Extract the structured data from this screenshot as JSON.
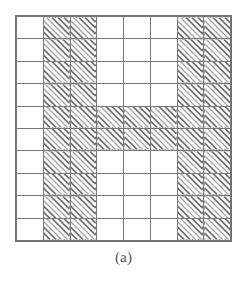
{
  "figure": {
    "caption": "(a)",
    "kind": "binary-grid-pattern",
    "depicted_glyph": "H",
    "colors": {
      "background": "#ffffff",
      "grid_line": "#787878",
      "border": "#6e6e6e",
      "hatch_line": "#4a4a4a",
      "caption_text": "#565656"
    }
  },
  "chart_data": {
    "type": "heatmap",
    "title": "",
    "subtitle": "",
    "xlabel": "",
    "ylabel": "",
    "legend": [],
    "annotations": [
      "(a)"
    ],
    "grid": true,
    "columns": 8,
    "rows": 10,
    "value_legend": {
      "0": "empty cell (white, unfilled)",
      "1": "filled cell (diagonal hatching)"
    },
    "column_labels": [
      "1",
      "2",
      "3",
      "4",
      "5",
      "6",
      "7",
      "8"
    ],
    "row_labels": [
      "1",
      "2",
      "3",
      "4",
      "5",
      "6",
      "7",
      "8",
      "9",
      "10"
    ],
    "values": [
      [
        0,
        1,
        1,
        0,
        0,
        0,
        1,
        1
      ],
      [
        0,
        1,
        1,
        0,
        0,
        0,
        1,
        1
      ],
      [
        0,
        1,
        1,
        0,
        0,
        0,
        1,
        1
      ],
      [
        0,
        1,
        1,
        0,
        0,
        0,
        1,
        1
      ],
      [
        0,
        1,
        1,
        1,
        1,
        1,
        1,
        1
      ],
      [
        0,
        1,
        1,
        1,
        1,
        1,
        1,
        1
      ],
      [
        0,
        1,
        1,
        0,
        0,
        0,
        1,
        1
      ],
      [
        0,
        1,
        1,
        0,
        0,
        0,
        1,
        1
      ],
      [
        0,
        1,
        1,
        0,
        0,
        0,
        1,
        1
      ],
      [
        0,
        1,
        1,
        0,
        0,
        0,
        1,
        1
      ]
    ],
    "filled_count": 52,
    "empty_count": 28
  }
}
